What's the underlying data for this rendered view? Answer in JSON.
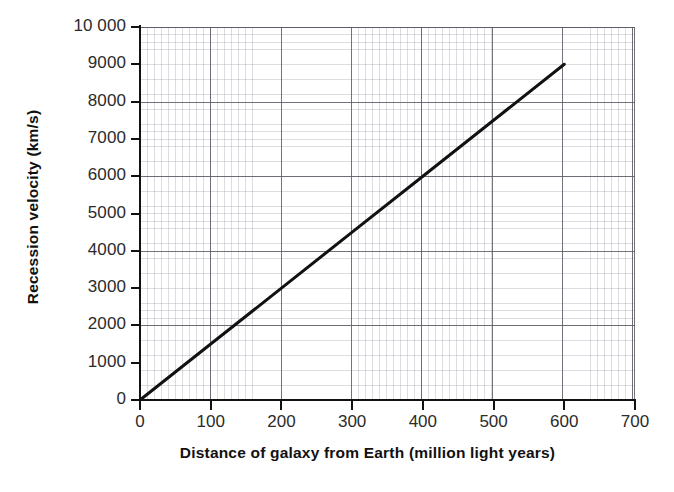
{
  "chart_data": {
    "type": "line",
    "title": "",
    "xlabel": "Distance of galaxy from Earth (million light years)",
    "ylabel": "Recession velocity (km/s)",
    "xlim": [
      0,
      700
    ],
    "ylim": [
      0,
      10000
    ],
    "xticks": [
      0,
      100,
      200,
      300,
      400,
      500,
      600,
      700
    ],
    "xtick_labels": [
      "0",
      "100",
      "200",
      "300",
      "400",
      "500",
      "600",
      "700"
    ],
    "yticks": [
      0,
      1000,
      2000,
      3000,
      4000,
      5000,
      6000,
      7000,
      8000,
      9000,
      10000
    ],
    "ytick_labels": [
      "0",
      "1000",
      "2000",
      "3000",
      "4000",
      "5000",
      "6000",
      "7000",
      "8000",
      "9000",
      "10 000"
    ],
    "grid": true,
    "grid_style": "graph-paper major and minor",
    "legend": "none",
    "series": [
      {
        "name": "Hubble relation",
        "color": "#111111",
        "line_width": 3,
        "x": [
          0,
          100,
          200,
          300,
          400,
          500,
          600
        ],
        "values": [
          0,
          1500,
          3000,
          4500,
          6000,
          7500,
          9000
        ]
      }
    ],
    "annotations": []
  },
  "figure": {
    "background_color": "#ffffff",
    "axis_color": "#111111",
    "grid_major_color": "#5a5a64",
    "grid_minor_color": "#78788c",
    "tick_label_color": "#2b2b2b"
  },
  "artifacts": {
    "fragment_left": "",
    "fragment_right": ""
  }
}
